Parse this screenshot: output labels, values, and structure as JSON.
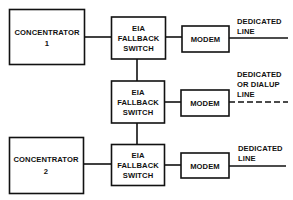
{
  "diagram": {
    "concentrators": [
      {
        "id": "concentrator-1",
        "label_line1": "CONCENTRATOR",
        "label_line2": "1"
      },
      {
        "id": "concentrator-2",
        "label_line1": "CONCENTRATOR",
        "label_line2": "2"
      }
    ],
    "switches": [
      {
        "id": "switch-1",
        "lines": [
          "EIA",
          "FALLBACK",
          "SWITCH"
        ]
      },
      {
        "id": "switch-2",
        "lines": [
          "EIA",
          "FALLBACK",
          "SWITCH"
        ]
      },
      {
        "id": "switch-3",
        "lines": [
          "EIA",
          "FALLBACK",
          "SWITCH"
        ]
      }
    ],
    "modems": [
      {
        "id": "modem-1",
        "label": "MODEM"
      },
      {
        "id": "modem-2",
        "label": "MODEM"
      },
      {
        "id": "modem-3",
        "label": "MODEM"
      }
    ],
    "lines": [
      {
        "id": "line-1",
        "label_lines": [
          "DEDICATED",
          "LINE"
        ],
        "style": "solid"
      },
      {
        "id": "line-2",
        "label_lines": [
          "DEDICATED",
          "OR DIALUP",
          "LINE"
        ],
        "style": "dashed"
      },
      {
        "id": "line-3",
        "label_lines": [
          "DEDICATED",
          "LINE"
        ],
        "style": "solid"
      }
    ],
    "colors": {
      "stroke": "#111111",
      "background": "#ffffff"
    }
  }
}
